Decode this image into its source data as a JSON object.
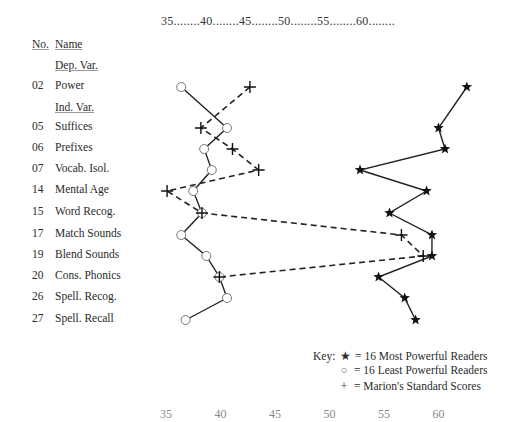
{
  "chart_data": {
    "type": "line",
    "title": "",
    "xlabel": "",
    "ylabel": "",
    "orientation": "horizontal-profile",
    "x_axis": {
      "ticks": [
        35,
        40,
        45,
        50,
        55,
        60
      ],
      "tick_label_string": "35........40........45........50........55........60........",
      "range": [
        35,
        63
      ],
      "position": "top (repeated, clipped, at bottom)"
    },
    "grid": false,
    "legend_position": "bottom-right",
    "header": {
      "no": "No.",
      "name": "Name"
    },
    "sections": [
      {
        "label": "Dep. Var.",
        "before_index": 0
      },
      {
        "label": "Ind. Var.",
        "before_index": 1
      }
    ],
    "categories": [
      {
        "no": "02",
        "name": "Power"
      },
      {
        "no": "05",
        "name": "Suffices"
      },
      {
        "no": "06",
        "name": "Prefixes"
      },
      {
        "no": "07",
        "name": "Vocab. Isol."
      },
      {
        "no": "14",
        "name": "Mental Age"
      },
      {
        "no": "15",
        "name": "Word Recog."
      },
      {
        "no": "17",
        "name": "Match Sounds"
      },
      {
        "no": "19",
        "name": "Blend Sounds"
      },
      {
        "no": "20",
        "name": "Cons. Phonics"
      },
      {
        "no": "26",
        "name": "Spell. Recog."
      },
      {
        "no": "27",
        "name": "Spell. Recall"
      }
    ],
    "series": [
      {
        "name": "16 Most Powerful Readers",
        "marker": "star",
        "line": "solid",
        "values": [
          62.6,
          60.0,
          60.6,
          52.8,
          58.9,
          55.5,
          59.4,
          59.4,
          54.5,
          56.9,
          57.9
        ]
      },
      {
        "name": "16 Least Powerful Readers",
        "marker": "circle",
        "line": "solid",
        "values": [
          36.4,
          40.6,
          38.5,
          39.2,
          37.5,
          38.3,
          36.4,
          38.7,
          39.9,
          40.6,
          36.8
        ]
      },
      {
        "name": "Marion's Standard Scores",
        "marker": "plus",
        "line": "dashed",
        "values": [
          42.7,
          38.2,
          41.1,
          43.5,
          35.1,
          38.3,
          56.6,
          58.6,
          39.9,
          null,
          null
        ]
      }
    ]
  },
  "labels": {
    "header_no": "No.",
    "header_name": "Name",
    "dep_var": "Dep. Var.",
    "ind_var": "Ind. Var.",
    "axis_top": "35........40........45........50........55........60........",
    "axis_bottom": [
      "35",
      "40",
      "45",
      "50",
      "55",
      "60"
    ],
    "rows": [
      {
        "no": "02",
        "name": "Power"
      },
      {
        "no": "05",
        "name": "Suffices"
      },
      {
        "no": "06",
        "name": "Prefixes"
      },
      {
        "no": "07",
        "name": "Vocab. Isol."
      },
      {
        "no": "14",
        "name": "Mental Age"
      },
      {
        "no": "15",
        "name": "Word Recog."
      },
      {
        "no": "17",
        "name": "Match Sounds"
      },
      {
        "no": "19",
        "name": "Blend Sounds"
      },
      {
        "no": "20",
        "name": "Cons. Phonics"
      },
      {
        "no": "26",
        "name": "Spell. Recog."
      },
      {
        "no": "27",
        "name": "Spell. Recall"
      }
    ],
    "key": {
      "prefix": "Key:",
      "star_symbol": "★",
      "circle_symbol": "○",
      "plus_symbol": "+",
      "equals": "=",
      "star_label": "16 Most Powerful Readers",
      "circle_label": "16 Least Powerful Readers",
      "plus_label": "Marion's Standard Scores"
    }
  },
  "colors": {
    "ink": "#2a2a2a",
    "circle": "#777777",
    "background": "#ffffff"
  }
}
